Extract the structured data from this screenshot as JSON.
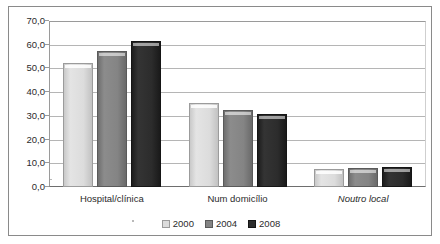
{
  "chart_data": {
    "type": "bar",
    "title": "",
    "subtitle": "",
    "xlabel": "",
    "ylabel": "",
    "categories": [
      "Hospital/clínica",
      "Num domicílio",
      "Noutro local"
    ],
    "series": [
      {
        "name": "2000",
        "color": "#dcdcdc",
        "values": [
          52.5,
          35.5,
          7.5
        ]
      },
      {
        "name": "2004",
        "color": "#848484",
        "values": [
          57.5,
          32.5,
          8.0
        ]
      },
      {
        "name": "2008",
        "color": "#2c2c2c",
        "values": [
          61.5,
          31.0,
          8.5
        ]
      }
    ],
    "ylim": [
      0,
      70
    ],
    "ytick_step": 10,
    "ytick_labels": [
      "70,0",
      "60,0",
      "50,0",
      "40,0",
      "30,0",
      "20,0",
      "10,0",
      "0,0"
    ],
    "ytick_values": [
      70,
      60,
      50,
      40,
      30,
      20,
      10,
      0
    ],
    "grid": true,
    "grid_axis": "y",
    "legend_position": "bottom-center",
    "decimal_separator": ",",
    "category_label_styles": [
      "normal",
      "normal",
      "italic"
    ]
  },
  "colors": {
    "series_2000": "#dcdcdc",
    "series_2004": "#848484",
    "series_2008": "#2c2c2c",
    "gridline": "#b5b5b5",
    "axis": "#6e6e6e",
    "frame": "#8a8a8a",
    "text": "#2b2b2b",
    "background": "#ffffff"
  }
}
